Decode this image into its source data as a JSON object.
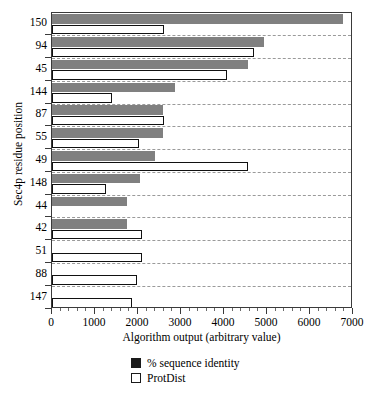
{
  "chart_data": {
    "type": "bar",
    "orientation": "horizontal",
    "title": "",
    "xlabel": "Algorithm output (arbitrary value)",
    "ylabel": "Sec4p residue position",
    "xlim": [
      0,
      7000
    ],
    "xticks": [
      0,
      1000,
      2000,
      3000,
      4000,
      5000,
      6000,
      7000
    ],
    "xtick_labels": [
      "0",
      "1000",
      "2000",
      "3000",
      "4000",
      "5000",
      "6000",
      "7000"
    ],
    "minor_tick_interval": 200,
    "grid": "horizontal-dashed",
    "legend_position": "bottom-center",
    "categories": [
      "150",
      "94",
      "45",
      "144",
      "87",
      "55",
      "49",
      "148",
      "44",
      "42",
      "51",
      "88",
      "147"
    ],
    "series": [
      {
        "name": "% sequence identity",
        "color": "#808080",
        "style": "filled",
        "values": [
          6760,
          4940,
          4560,
          2860,
          2580,
          2580,
          2400,
          2050,
          1750,
          1740,
          0,
          0,
          0
        ]
      },
      {
        "name": "ProtDist",
        "color": "#ffffff",
        "style": "open",
        "values": [
          2600,
          4700,
          4060,
          1400,
          2610,
          2020,
          4560,
          1260,
          0,
          2090,
          2100,
          1980,
          1860
        ]
      }
    ]
  },
  "legend": {
    "items": [
      {
        "label": "% sequence identity",
        "swatch": "filled-square"
      },
      {
        "label": "ProtDist",
        "swatch": "open-square"
      }
    ]
  }
}
